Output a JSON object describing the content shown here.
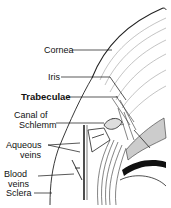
{
  "diagram": {
    "labels": {
      "cornea": "Cornea",
      "iris": "Iris",
      "trabeculae": "Trabeculae",
      "canal_line1": "Canal   of",
      "canal_line2": "Schlemm",
      "aqueous_line1": "Aqueous",
      "aqueous_line2": "veins",
      "blood_line1": "Blood",
      "blood_line2": "veins",
      "sclera": "Sclera"
    }
  }
}
